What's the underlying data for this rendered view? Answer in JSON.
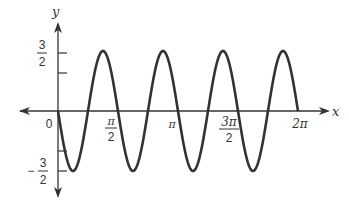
{
  "chart_data": {
    "type": "line",
    "title": "",
    "function": "y = -(3/2) sin(4x)",
    "xlabel": "x",
    "ylabel": "y",
    "xlim": [
      0,
      6.2832
    ],
    "ylim": [
      -1.5,
      1.5
    ],
    "grid": false,
    "legend": null,
    "x_ticks": [
      {
        "value": 0,
        "label": "0"
      },
      {
        "value": 1.5708,
        "label_num": "π",
        "label_den": "2"
      },
      {
        "value": 3.1416,
        "label": "π"
      },
      {
        "value": 4.7124,
        "label_num": "3π",
        "label_den": "2"
      },
      {
        "value": 6.2832,
        "label": "2π"
      }
    ],
    "y_ticks": [
      {
        "value": 1.5,
        "label_num": "3",
        "label_den": "2"
      },
      {
        "value": 1,
        "label": ""
      },
      {
        "value": -1,
        "label": ""
      },
      {
        "value": -1.5,
        "label_sign": "−",
        "label_num": "3",
        "label_den": "2"
      }
    ],
    "series": [
      {
        "name": "y = -(3/2) sin 4x",
        "x": [
          0,
          0.3927,
          0.7854,
          1.1781,
          1.5708,
          1.9635,
          2.3562,
          2.7489,
          3.1416,
          3.5343,
          3.927,
          4.3197,
          4.7124,
          5.1051,
          5.4978,
          5.8905,
          6.2832
        ],
        "values": [
          0,
          -1.5,
          0,
          1.5,
          0,
          -1.5,
          0,
          1.5,
          0,
          -1.5,
          0,
          1.5,
          0,
          -1.5,
          0,
          1.5,
          0
        ]
      }
    ],
    "color": "#333333"
  }
}
